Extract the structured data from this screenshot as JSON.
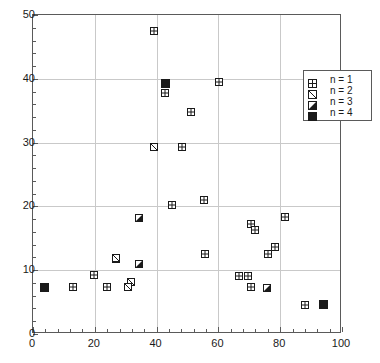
{
  "chart_data": {
    "type": "scatter",
    "title": "",
    "xlabel": "",
    "ylabel": "",
    "xlim": [
      0,
      100
    ],
    "ylim": [
      0,
      50
    ],
    "grid": true,
    "xticks": [
      0,
      20,
      40,
      60,
      80,
      100
    ],
    "yticks": [
      0,
      10,
      20,
      30,
      40,
      50
    ],
    "xticklabels": [
      "0",
      "20",
      "40",
      "60",
      "80",
      "100"
    ],
    "yticklabels": [
      "0",
      "10",
      "20",
      "30",
      "40",
      "50"
    ],
    "x_minor_step": 4,
    "y_minor_step": 2,
    "legend_position": "upper right",
    "series": [
      {
        "name": "n = 1",
        "marker": "square-plus",
        "points": [
          [
            39.0,
            47.5
          ],
          [
            60.2,
            39.5
          ],
          [
            42.6,
            37.7
          ],
          [
            51.0,
            34.8
          ],
          [
            48.2,
            29.3
          ],
          [
            55.5,
            21.0
          ],
          [
            45.0,
            20.2
          ],
          [
            81.5,
            18.3
          ],
          [
            70.5,
            17.2
          ],
          [
            72.0,
            16.3
          ],
          [
            78.2,
            13.6
          ],
          [
            55.8,
            12.6
          ],
          [
            76.0,
            12.5
          ],
          [
            27.0,
            11.8
          ],
          [
            19.7,
            9.2
          ],
          [
            66.6,
            9.1
          ],
          [
            69.7,
            9.1
          ],
          [
            13.0,
            7.3
          ],
          [
            23.8,
            7.4
          ],
          [
            70.5,
            7.3
          ],
          [
            88.0,
            4.6
          ]
        ]
      },
      {
        "name": "n = 2",
        "marker": "square-diagonal",
        "points": [
          [
            39.0,
            29.3
          ],
          [
            27.0,
            11.9
          ],
          [
            31.8,
            8.2
          ],
          [
            30.6,
            7.3
          ]
        ]
      },
      {
        "name": "n = 3",
        "marker": "square-half",
        "points": [
          [
            34.3,
            18.2
          ],
          [
            34.3,
            10.9
          ],
          [
            75.8,
            7.2
          ]
        ]
      },
      {
        "name": "n = 4",
        "marker": "square-filled",
        "points": [
          [
            43.0,
            39.3
          ],
          [
            3.6,
            7.3
          ],
          [
            94.0,
            4.6
          ]
        ]
      }
    ]
  },
  "legend": {
    "items": [
      {
        "label": "n = 1",
        "marker": "square-plus"
      },
      {
        "label": "n = 2",
        "marker": "square-diagonal"
      },
      {
        "label": "n = 3",
        "marker": "square-half"
      },
      {
        "label": "n = 4",
        "marker": "square-filled"
      }
    ]
  },
  "colors": {
    "axis": "#5a5a5a",
    "grid": "#c9c9c9",
    "marker": "#1a1a1a",
    "background": "#ffffff"
  }
}
